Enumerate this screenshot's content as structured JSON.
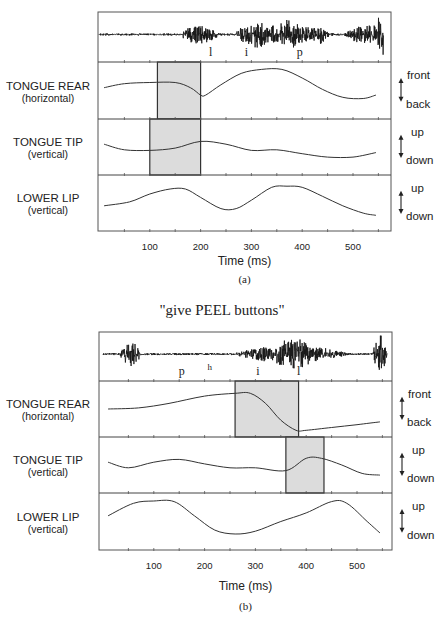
{
  "chart_data": [
    {
      "type": "line",
      "id": "a",
      "title": "\"give LEAP buttons\"",
      "title_visible": false,
      "caption": "(a)",
      "xlabel": "Time (ms)",
      "xlim": [
        0,
        575
      ],
      "xticks": [
        100,
        200,
        300,
        400,
        500
      ],
      "xtick_labels": [
        "100",
        "200",
        "300",
        "400",
        "500"
      ],
      "waveform": {
        "name": "acoustic waveform",
        "segment_labels": [
          {
            "label": "l",
            "t": 220
          },
          {
            "label": "i",
            "t": 290
          },
          {
            "label": "p",
            "t": 395
          }
        ],
        "bursts": [
          {
            "t0": 155,
            "t1": 240,
            "amp": 0.35
          },
          {
            "t0": 260,
            "t1": 470,
            "amp": 0.35
          },
          {
            "t0": 505,
            "t1": 590,
            "amp": 0.4
          },
          {
            "t0": 265,
            "t1": 350,
            "amp": 0.5
          },
          {
            "t0": 335,
            "t1": 415,
            "amp": 0.55
          },
          {
            "t0": 410,
            "t1": 455,
            "amp": 0.35
          },
          {
            "t0": 480,
            "t1": 570,
            "amp": 0.35
          },
          {
            "t0": 530,
            "t1": 560,
            "amp": 0.4
          },
          {
            "t0": 540,
            "t1": 575,
            "amp": 0.9
          }
        ]
      },
      "series": [
        {
          "name": "TONGUE REAR",
          "sublabel": "(horizontal)",
          "direction_up": "front",
          "direction_down": "back",
          "t": [
            10,
            50,
            100,
            150,
            180,
            200,
            210,
            240,
            280,
            320,
            360,
            400,
            440,
            480,
            520,
            545
          ],
          "y": [
            0.55,
            0.62,
            0.64,
            0.64,
            0.55,
            0.42,
            0.42,
            0.6,
            0.8,
            0.87,
            0.87,
            0.72,
            0.52,
            0.38,
            0.36,
            0.42
          ],
          "highlight": {
            "t0": 115,
            "t1": 200
          }
        },
        {
          "name": "TONGUE TIP",
          "sublabel": "(vertical)",
          "direction_up": "up",
          "direction_down": "down",
          "t": [
            10,
            50,
            100,
            150,
            200,
            250,
            300,
            350,
            400,
            450,
            500,
            545
          ],
          "y": [
            0.55,
            0.45,
            0.44,
            0.48,
            0.6,
            0.55,
            0.44,
            0.45,
            0.38,
            0.32,
            0.32,
            0.4
          ],
          "highlight": {
            "t0": 100,
            "t1": 200
          }
        },
        {
          "name": "LOWER LIP",
          "sublabel": "(vertical)",
          "direction_up": "up",
          "direction_down": "down",
          "t": [
            10,
            60,
            100,
            140,
            170,
            200,
            240,
            270,
            300,
            340,
            370,
            400,
            440,
            480,
            520,
            545
          ],
          "y": [
            0.45,
            0.52,
            0.66,
            0.75,
            0.75,
            0.6,
            0.4,
            0.4,
            0.55,
            0.78,
            0.8,
            0.78,
            0.62,
            0.45,
            0.32,
            0.28
          ],
          "highlight": null
        }
      ]
    },
    {
      "type": "line",
      "id": "b",
      "title": "\"give PEEL buttons\"",
      "title_visible": true,
      "caption": "(b)",
      "xlabel": "Time (ms)",
      "xlim": [
        0,
        575
      ],
      "xticks": [
        100,
        200,
        300,
        400,
        500
      ],
      "xtick_labels": [
        "100",
        "200",
        "300",
        "400",
        "500"
      ],
      "waveform": {
        "name": "acoustic waveform",
        "segment_labels": [
          {
            "label": "p",
            "t": 155,
            "superscript": false
          },
          {
            "label": "h",
            "t": 210,
            "superscript": true
          },
          {
            "label": "i",
            "t": 305,
            "superscript": false
          },
          {
            "label": "l",
            "t": 385,
            "superscript": false
          }
        ],
        "bursts": [
          {
            "t0": 30,
            "t1": 80,
            "amp": 0.45
          },
          {
            "t0": 250,
            "t1": 490,
            "amp": 0.35
          },
          {
            "t0": 320,
            "t1": 430,
            "amp": 0.6
          },
          {
            "t0": 360,
            "t1": 400,
            "amp": 0.8
          },
          {
            "t0": 530,
            "t1": 560,
            "amp": 0.75
          }
        ]
      },
      "series": [
        {
          "name": "TONGUE REAR",
          "sublabel": "(horizontal)",
          "direction_up": "front",
          "direction_down": "back",
          "t": [
            10,
            70,
            130,
            200,
            260,
            290,
            320,
            350,
            380,
            400,
            450,
            500,
            545
          ],
          "y": [
            0.5,
            0.52,
            0.6,
            0.73,
            0.78,
            0.78,
            0.6,
            0.3,
            0.12,
            0.12,
            0.17,
            0.22,
            0.27
          ],
          "highlight": {
            "t0": 260,
            "t1": 385
          }
        },
        {
          "name": "TONGUE TIP",
          "sublabel": "(vertical)",
          "direction_up": "up",
          "direction_down": "down",
          "t": [
            10,
            50,
            100,
            150,
            200,
            250,
            300,
            360,
            400,
            430,
            470,
            510,
            545
          ],
          "y": [
            0.55,
            0.45,
            0.55,
            0.6,
            0.52,
            0.45,
            0.45,
            0.4,
            0.62,
            0.62,
            0.5,
            0.35,
            0.32
          ],
          "highlight": {
            "t0": 360,
            "t1": 435
          }
        },
        {
          "name": "LOWER LIP",
          "sublabel": "(vertical)",
          "direction_up": "up",
          "direction_down": "down",
          "t": [
            10,
            60,
            100,
            140,
            180,
            220,
            260,
            300,
            350,
            400,
            450,
            480,
            520,
            545
          ],
          "y": [
            0.6,
            0.82,
            0.86,
            0.85,
            0.6,
            0.35,
            0.28,
            0.33,
            0.5,
            0.65,
            0.85,
            0.82,
            0.5,
            0.3
          ],
          "highlight": null
        }
      ]
    }
  ]
}
